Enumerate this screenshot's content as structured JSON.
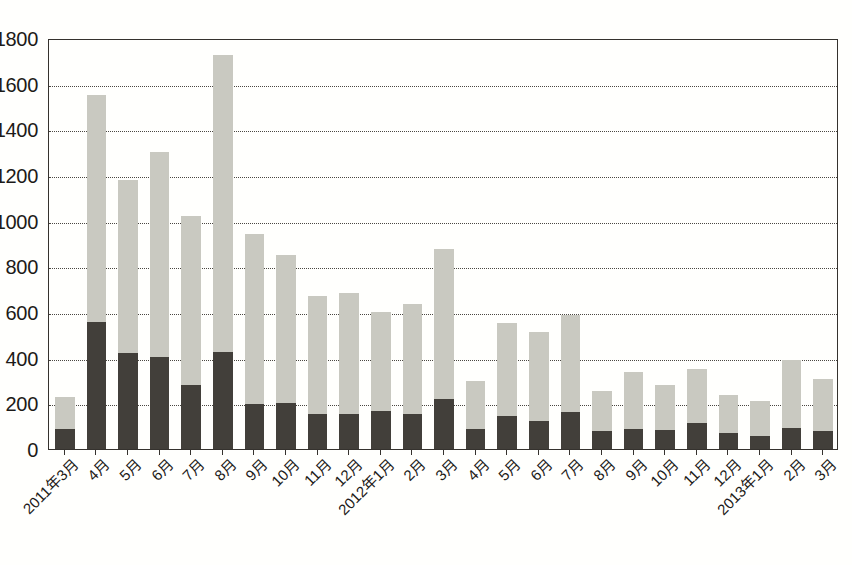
{
  "chart_data": {
    "type": "bar",
    "stacked": true,
    "title": "",
    "subtitle": "",
    "xlabel": "",
    "ylabel": "",
    "ylim": [
      0,
      1800
    ],
    "ytick_step": 200,
    "ytick_labels": [
      "0",
      "200",
      "400",
      "600",
      "800",
      "1000",
      "1200",
      "1400",
      "1600",
      "1800"
    ],
    "grid": true,
    "legend_position": "none",
    "categories": [
      "2011年3月",
      "4月",
      "5月",
      "6月",
      "7月",
      "8月",
      "9月",
      "10月",
      "11月",
      "12月",
      "2012年1月",
      "2月",
      "3月",
      "4月",
      "5月",
      "6月",
      "7月",
      "8月",
      "9月",
      "10月",
      "11月",
      "12月",
      "2013年1月",
      "2月",
      "3月"
    ],
    "series": [
      {
        "name": "lower",
        "color": "#423f3a",
        "values": [
          88,
          555,
          422,
          405,
          282,
          425,
          198,
          200,
          152,
          155,
          168,
          152,
          220,
          88,
          145,
          122,
          162,
          78,
          88,
          85,
          112,
          72,
          55,
          92,
          78
        ]
      },
      {
        "name": "upper",
        "color": "#c9c9c1",
        "values": [
          140,
          995,
          758,
          898,
          737,
          1300,
          745,
          648,
          518,
          530,
          432,
          485,
          655,
          208,
          405,
          392,
          425,
          178,
          248,
          195,
          238,
          165,
          155,
          298,
          228
        ]
      }
    ],
    "totals": [
      228,
      1550,
      1180,
      1303,
      1019,
      1725,
      943,
      848,
      670,
      685,
      600,
      637,
      875,
      296,
      550,
      514,
      587,
      256,
      336,
      280,
      350,
      237,
      210,
      390,
      306
    ]
  },
  "caption": {
    "bottom_partial": ""
  }
}
